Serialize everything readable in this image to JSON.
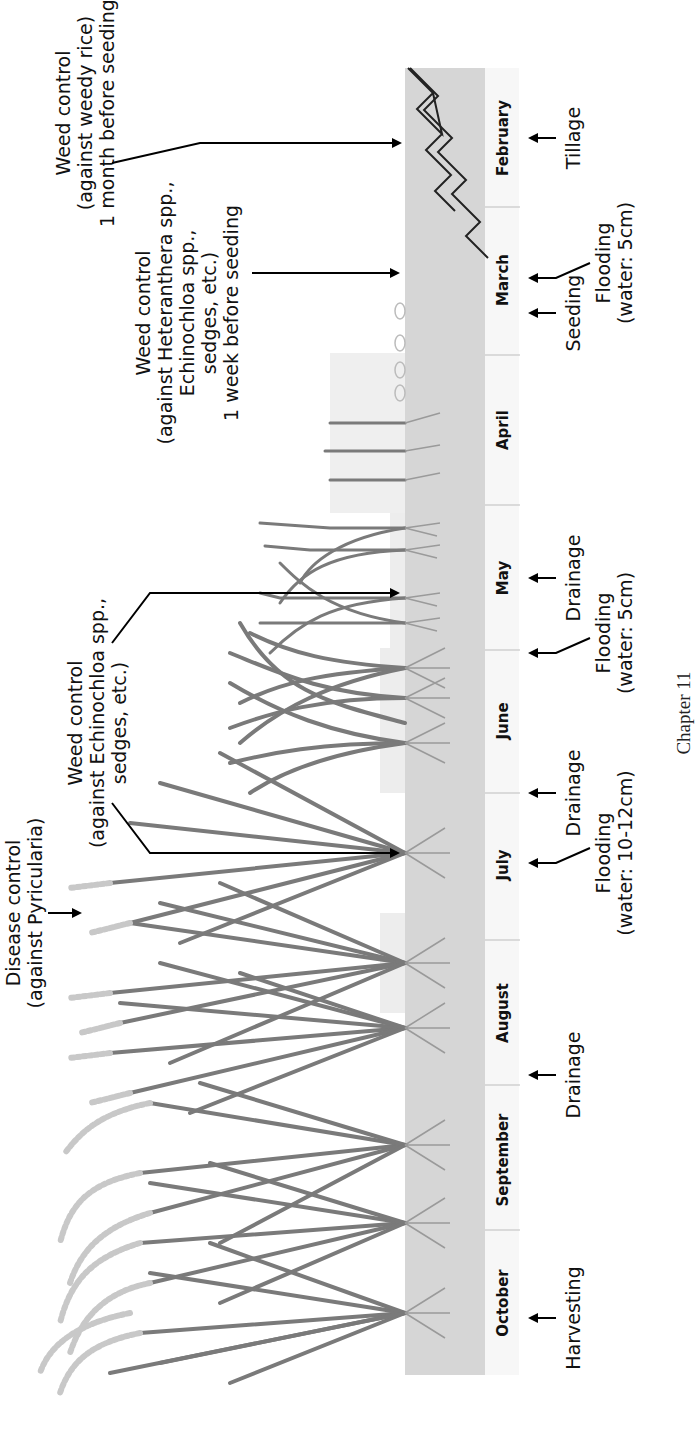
{
  "figure": {
    "type": "rice cultivation calendar diagram",
    "orientation": "rotated 90 degrees counter-clockwise",
    "months": [
      "February",
      "March",
      "April",
      "May",
      "June",
      "July",
      "August",
      "September",
      "October"
    ],
    "operations_below": [
      {
        "id": "tillage",
        "label": "Tillage",
        "month": "February"
      },
      {
        "id": "flooding-1",
        "label_line1": "Flooding",
        "label_line2": "(water: 5cm)",
        "month": "March"
      },
      {
        "id": "seeding",
        "label": "Seeding",
        "month": "March"
      },
      {
        "id": "drainage-1",
        "label": "Drainage",
        "month": "May"
      },
      {
        "id": "flooding-2",
        "label_line1": "Flooding",
        "label_line2": "(water: 5cm)",
        "month": "May/June"
      },
      {
        "id": "drainage-2",
        "label": "Drainage",
        "month": "June/July"
      },
      {
        "id": "flooding-3",
        "label_line1": "Flooding",
        "label_line2": "(water: 10-12cm)",
        "month": "July"
      },
      {
        "id": "drainage-3",
        "label": "Drainage",
        "month": "August/September"
      },
      {
        "id": "harvesting",
        "label": "Harvesting",
        "month": "October"
      }
    ],
    "controls_above": [
      {
        "id": "weed-control-1",
        "lines": [
          "Weed control",
          "(against weedy rice)",
          "1 month before seeding"
        ]
      },
      {
        "id": "weed-control-2",
        "lines": [
          "Weed control",
          "(against Heteranthera spp.,",
          "Echinochloa spp.,",
          "sedges, etc.)",
          "1 week before seeding"
        ]
      },
      {
        "id": "weed-control-3",
        "lines": [
          "Weed control",
          "(against Echinochloa spp.,",
          "sedges, etc.)"
        ]
      },
      {
        "id": "disease-control",
        "lines": [
          "Disease control",
          "(against Pyricularia)"
        ]
      }
    ]
  },
  "caption": "Chapter 11",
  "colors": {
    "ground": "#d6d6d6",
    "water": "#ececec",
    "month_bar": "#f7f7f7",
    "plant": "#7a7a7a",
    "arrow": "#000000"
  }
}
